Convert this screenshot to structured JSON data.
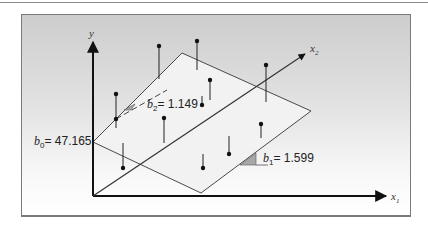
{
  "figure": {
    "title": "",
    "axes": {
      "y": {
        "label": "y"
      },
      "x1": {
        "label": "x",
        "sub": "1"
      },
      "x2": {
        "label": "x",
        "sub": "2"
      }
    },
    "coefficients": {
      "b0": {
        "symbol": "b",
        "sub": "0",
        "text": "= 47.165",
        "value": 47.165
      },
      "b1": {
        "symbol": "b",
        "sub": "1",
        "text": "= 1.599",
        "value": 1.599
      },
      "b2": {
        "symbol": "b",
        "sub": "2",
        "text": "= 1.149",
        "value": 1.149
      }
    },
    "colors": {
      "background_top": "#cdcdcd",
      "background_bottom": "#ffffff",
      "plane_fill": "#f2f2f2",
      "line": "#444444",
      "slope_triangle": "#a8a8a8"
    },
    "data_points": [
      {
        "dot": [
          116,
          94
        ],
        "plane": [
          116,
          128
        ]
      },
      {
        "dot": [
          116,
          119
        ],
        "plane": [
          116,
          119
        ]
      },
      {
        "dot": [
          159,
          46
        ],
        "plane": [
          159,
          79
        ]
      },
      {
        "dot": [
          197,
          41
        ],
        "plane": [
          197,
          70
        ]
      },
      {
        "dot": [
          210,
          80
        ],
        "plane": [
          210,
          100
        ]
      },
      {
        "dot": [
          202,
          105
        ],
        "plane": [
          202,
          95
        ]
      },
      {
        "dot": [
          164,
          118
        ],
        "plane": [
          164,
          143
        ]
      },
      {
        "dot": [
          123,
          168
        ],
        "plane": [
          123,
          143
        ]
      },
      {
        "dot": [
          266,
          65
        ],
        "plane": [
          266,
          102
        ]
      },
      {
        "dot": [
          261,
          124
        ],
        "plane": [
          261,
          138
        ]
      },
      {
        "dot": [
          229,
          154
        ],
        "plane": [
          229,
          136
        ]
      },
      {
        "dot": [
          203,
          168
        ],
        "plane": [
          203,
          154
        ]
      }
    ]
  }
}
